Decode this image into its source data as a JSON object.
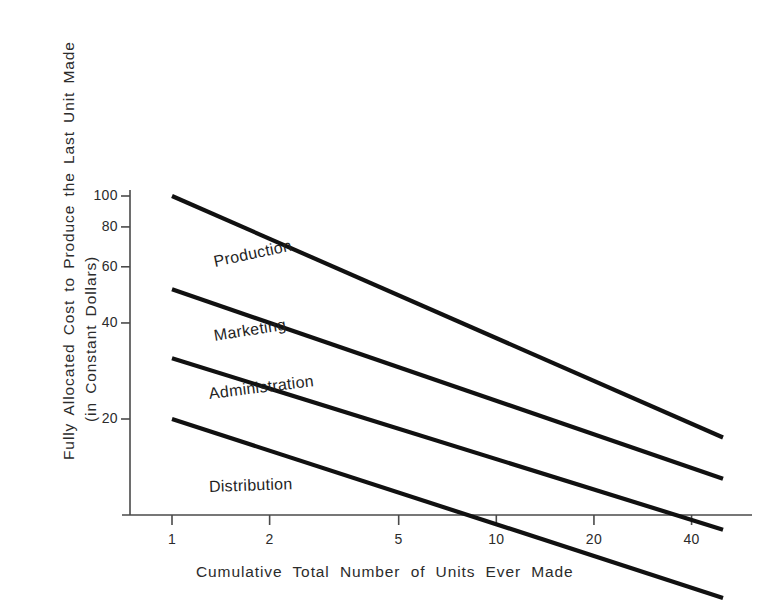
{
  "chart_data": {
    "type": "line",
    "title": "",
    "subtitle": "",
    "xlabel": "Cumulative  Total  Number  of  Units  Ever  Made",
    "ylabel_line1": "Fully  Allocated  Cost  to  Produce  the  Last  Unit  Made",
    "ylabel_line2": "(in  Constant  Dollars)",
    "xscale": "log",
    "yscale": "log",
    "xlim": [
      1,
      55
    ],
    "ylim": [
      4,
      110
    ],
    "grid": false,
    "legend": "inline-labels",
    "xticks": [
      {
        "value": 1,
        "label": "1"
      },
      {
        "value": 2,
        "label": "2"
      },
      {
        "value": 5,
        "label": "5"
      },
      {
        "value": 10,
        "label": "10"
      },
      {
        "value": 20,
        "label": "20"
      },
      {
        "value": 40,
        "label": "40"
      }
    ],
    "yticks": [
      {
        "value": 20,
        "label": "20"
      },
      {
        "value": 40,
        "label": "40"
      },
      {
        "value": 60,
        "label": "60"
      },
      {
        "value": 80,
        "label": "80"
      },
      {
        "value": 100,
        "label": "100"
      }
    ],
    "x": [
      1,
      50
    ],
    "series": [
      {
        "name": "Production",
        "values": [
          100,
          17.5
        ],
        "label": "Production"
      },
      {
        "name": "Marketing",
        "values": [
          51,
          13
        ],
        "label": "Marketing"
      },
      {
        "name": "Administration",
        "values": [
          31,
          9
        ],
        "label": "Administration"
      },
      {
        "name": "Distribution",
        "values": [
          20,
          5.5
        ],
        "label": "Distribution"
      }
    ],
    "annotations": [
      {
        "text": "Production",
        "x": 1.35,
        "y": 62,
        "rotation": -12
      },
      {
        "text": "Marketing",
        "x": 1.35,
        "y": 36.5,
        "rotation": -9
      },
      {
        "text": "Administration",
        "x": 1.3,
        "y": 24,
        "rotation": -7
      },
      {
        "text": "Distribution",
        "x": 1.3,
        "y": 12.2,
        "rotation": -2
      }
    ],
    "colors": {
      "line": "#111111",
      "axis": "#4a4a4a",
      "text": "#2b2b2b",
      "background": "#ffffff"
    }
  }
}
